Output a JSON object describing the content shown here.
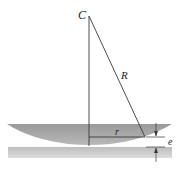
{
  "diagram": {
    "labels": {
      "center": "C",
      "radius": "R",
      "ring_radius": "r",
      "gap": "e"
    },
    "colors": {
      "line": "#3a3a3a",
      "lens_fill_dark": "#8c8c8c",
      "lens_fill_light": "#d2d2d2",
      "plate_fill": "#c8c8c8",
      "background": "#ffffff"
    }
  }
}
